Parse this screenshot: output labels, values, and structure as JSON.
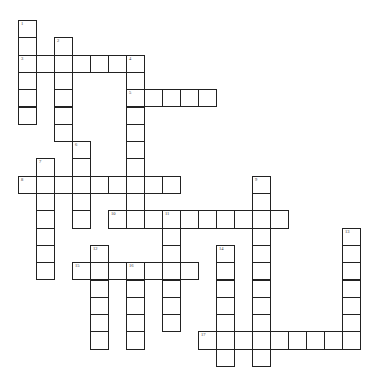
{
  "puzzle": {
    "type": "crossword",
    "grid_columns": 19,
    "grid_rows": 20,
    "entries": [
      {
        "number": "1",
        "direction": "down",
        "col": 0,
        "row": 0,
        "length": 6
      },
      {
        "number": "2",
        "direction": "down",
        "col": 2,
        "row": 1,
        "length": 6
      },
      {
        "number": "3",
        "direction": "across",
        "col": 0,
        "row": 2,
        "length": 7
      },
      {
        "number": "4",
        "direction": "down",
        "col": 6,
        "row": 2,
        "length": 10
      },
      {
        "number": "5",
        "direction": "across",
        "col": 6,
        "row": 4,
        "length": 5
      },
      {
        "number": "6",
        "direction": "down",
        "col": 3,
        "row": 7,
        "length": 5
      },
      {
        "number": "7",
        "direction": "down",
        "col": 1,
        "row": 8,
        "length": 7
      },
      {
        "number": "8",
        "direction": "across",
        "col": 0,
        "row": 9,
        "length": 9
      },
      {
        "number": "9",
        "direction": "down",
        "col": 13,
        "row": 9,
        "length": 11
      },
      {
        "number": "10",
        "direction": "across",
        "col": 5,
        "row": 11,
        "length": 10
      },
      {
        "number": "11",
        "direction": "down",
        "col": 8,
        "row": 11,
        "length": 7
      },
      {
        "number": "12",
        "direction": "down",
        "col": 4,
        "row": 13,
        "length": 6
      },
      {
        "number": "13",
        "direction": "down",
        "col": 18,
        "row": 12,
        "length": 7
      },
      {
        "number": "14",
        "direction": "down",
        "col": 11,
        "row": 13,
        "length": 7
      },
      {
        "number": "15",
        "direction": "across",
        "col": 3,
        "row": 14,
        "length": 7
      },
      {
        "number": "16",
        "direction": "down",
        "col": 6,
        "row": 14,
        "length": 5
      },
      {
        "number": "17",
        "direction": "across",
        "col": 10,
        "row": 18,
        "length": 9
      }
    ]
  }
}
